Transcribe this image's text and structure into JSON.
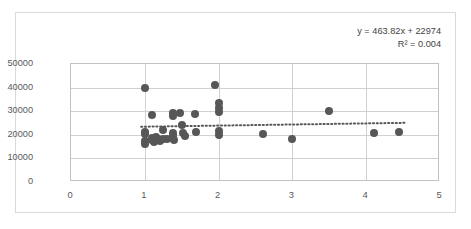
{
  "chart_data": {
    "type": "scatter",
    "title": "",
    "xlabel": "",
    "ylabel": "",
    "xlim": [
      0,
      5
    ],
    "ylim": [
      0,
      50000
    ],
    "grid": true,
    "legend": false,
    "xticks": [
      "0",
      "1",
      "2",
      "3",
      "4",
      "5"
    ],
    "yticks": [
      "0",
      "10000",
      "20000",
      "30000",
      "40000",
      "50000"
    ],
    "annotations": {
      "equation": "y = 463.82x + 22974",
      "r_squared": "R² = 0.004"
    },
    "trendline": {
      "type": "linear",
      "style": "dotted",
      "slope": 463.82,
      "intercept": 22974,
      "x_start": 0.95,
      "x_end": 4.55,
      "color": "#595959"
    },
    "marker": {
      "shape": "circle",
      "color": "#575757",
      "size": 8
    },
    "points": [
      {
        "x": 1.0,
        "y": 40000
      },
      {
        "x": 1.0,
        "y": 21000
      },
      {
        "x": 1.0,
        "y": 20300
      },
      {
        "x": 1.0,
        "y": 17400
      },
      {
        "x": 1.0,
        "y": 15900
      },
      {
        "x": 1.1,
        "y": 28500
      },
      {
        "x": 1.1,
        "y": 18800
      },
      {
        "x": 1.1,
        "y": 17800
      },
      {
        "x": 1.12,
        "y": 16900
      },
      {
        "x": 1.15,
        "y": 19000
      },
      {
        "x": 1.18,
        "y": 18100
      },
      {
        "x": 1.2,
        "y": 17300
      },
      {
        "x": 1.25,
        "y": 22000
      },
      {
        "x": 1.25,
        "y": 18300
      },
      {
        "x": 1.3,
        "y": 18200
      },
      {
        "x": 1.38,
        "y": 29300
      },
      {
        "x": 1.38,
        "y": 28000
      },
      {
        "x": 1.38,
        "y": 20800
      },
      {
        "x": 1.38,
        "y": 19600
      },
      {
        "x": 1.4,
        "y": 18000
      },
      {
        "x": 1.48,
        "y": 29300
      },
      {
        "x": 1.5,
        "y": 24100
      },
      {
        "x": 1.52,
        "y": 20900
      },
      {
        "x": 1.55,
        "y": 19700
      },
      {
        "x": 1.68,
        "y": 28800
      },
      {
        "x": 1.7,
        "y": 21000
      },
      {
        "x": 1.95,
        "y": 41000
      },
      {
        "x": 2.0,
        "y": 33500
      },
      {
        "x": 2.0,
        "y": 31500
      },
      {
        "x": 2.0,
        "y": 29800
      },
      {
        "x": 2.0,
        "y": 21500
      },
      {
        "x": 2.0,
        "y": 19900
      },
      {
        "x": 2.6,
        "y": 20400
      },
      {
        "x": 3.0,
        "y": 18400
      },
      {
        "x": 3.5,
        "y": 29900
      },
      {
        "x": 4.1,
        "y": 20700
      },
      {
        "x": 4.45,
        "y": 21200
      }
    ]
  }
}
